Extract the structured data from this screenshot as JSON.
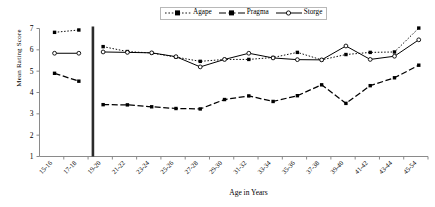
{
  "chart_data": {
    "type": "line",
    "title": "",
    "xlabel": "Age in Years",
    "ylabel": "Mean Rating Score",
    "ylim": [
      1,
      7
    ],
    "yticks": [
      "1",
      "2",
      "3",
      "4",
      "5",
      "6",
      "7"
    ],
    "grid": false,
    "legend_position": "top-center",
    "categories": [
      "15-16",
      "17-18",
      "19-20",
      "21-22",
      "23-24",
      "25-26",
      "27-28",
      "29-30",
      "31-32",
      "33-34",
      "35-36",
      "37-38",
      "39-40",
      "41-42",
      "43-44",
      "45-54"
    ],
    "series": [
      {
        "name": "Agape",
        "color": "#000000",
        "style": "dotted",
        "marker": "filled-square",
        "values": [
          6.82,
          6.93,
          6.15,
          5.92,
          5.85,
          5.66,
          5.46,
          5.55,
          5.55,
          5.64,
          5.88,
          5.53,
          5.78,
          5.88,
          5.9,
          7.02
        ]
      },
      {
        "name": "Pragma",
        "color": "#000000",
        "style": "dashed",
        "marker": "filled-square",
        "values": [
          4.9,
          4.53,
          3.43,
          3.42,
          3.33,
          3.25,
          3.23,
          3.67,
          3.84,
          3.58,
          3.85,
          4.36,
          3.49,
          4.32,
          4.69,
          5.28
        ]
      },
      {
        "name": "Storge",
        "color": "#000000",
        "style": "solid",
        "marker": "open-circle",
        "values": [
          5.84,
          5.84,
          5.9,
          5.88,
          5.86,
          5.68,
          5.2,
          5.55,
          5.84,
          5.62,
          5.54,
          5.53,
          6.18,
          5.55,
          5.7,
          6.47
        ]
      }
    ],
    "divider": {
      "after_category": "17-18",
      "note": "thick vertical rule separating the 15-18 group from the 19+ groups"
    }
  },
  "legend": {
    "items": [
      {
        "label": "Agape"
      },
      {
        "label": "Pragma"
      },
      {
        "label": "Storge"
      }
    ]
  },
  "axes": {
    "y_title": "Mean Rating Score",
    "x_title": "Age in Years"
  }
}
